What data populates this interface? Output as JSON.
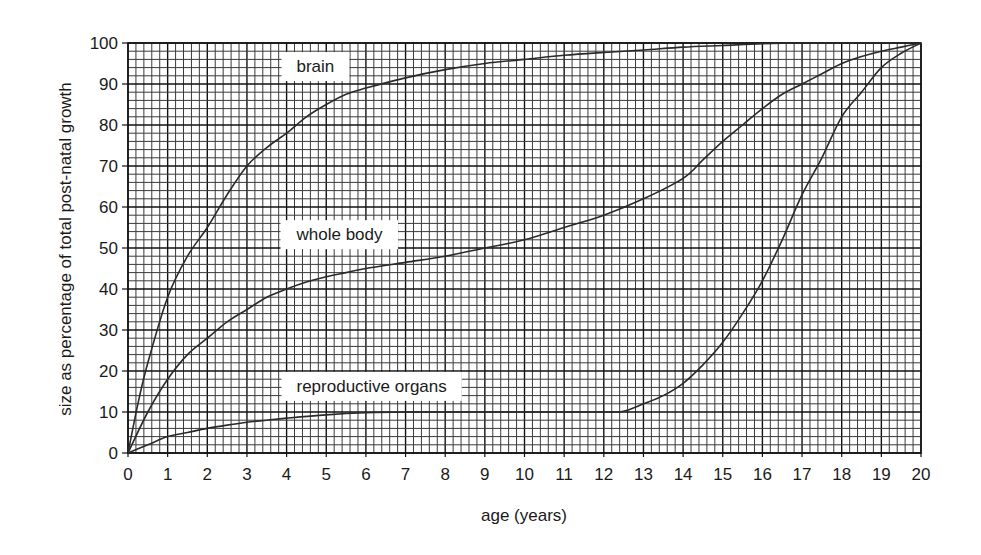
{
  "chart_data": {
    "type": "line",
    "title": "",
    "xlabel": "age (years)",
    "ylabel": "size as percentage of total post-natal growth",
    "xlim": [
      0,
      20
    ],
    "ylim": [
      0,
      100
    ],
    "x_ticks": [
      0,
      1,
      2,
      3,
      4,
      5,
      6,
      7,
      8,
      9,
      10,
      11,
      12,
      13,
      14,
      15,
      16,
      17,
      18,
      19,
      20
    ],
    "y_ticks": [
      0,
      10,
      20,
      30,
      40,
      50,
      60,
      70,
      80,
      90,
      100
    ],
    "grid": {
      "on": true,
      "x_minor_step": 0.2,
      "y_minor_step": 2,
      "style": "graph-paper"
    },
    "legend": {
      "position": "inline-labels"
    },
    "series": [
      {
        "name": "brain",
        "label_pos": {
          "x": 4.25,
          "y": 94
        },
        "points": [
          [
            0,
            0
          ],
          [
            0.25,
            12
          ],
          [
            0.5,
            22
          ],
          [
            1,
            38
          ],
          [
            1.5,
            48
          ],
          [
            2,
            55
          ],
          [
            2.5,
            63
          ],
          [
            3,
            70
          ],
          [
            3.5,
            74.5
          ],
          [
            4,
            78
          ],
          [
            4.5,
            82
          ],
          [
            5,
            85
          ],
          [
            5.5,
            87.5
          ],
          [
            6,
            89
          ],
          [
            7,
            91.5
          ],
          [
            8,
            93.5
          ],
          [
            9,
            95
          ],
          [
            10,
            96
          ],
          [
            11,
            97
          ],
          [
            12,
            97.7
          ],
          [
            13,
            98.3
          ],
          [
            14,
            99
          ],
          [
            15,
            99.4
          ],
          [
            16,
            99.8
          ],
          [
            17,
            100
          ],
          [
            18,
            100
          ],
          [
            19,
            100
          ],
          [
            20,
            100
          ]
        ]
      },
      {
        "name": "whole body",
        "label_pos": {
          "x": 4.25,
          "y": 53
        },
        "points": [
          [
            0,
            0
          ],
          [
            0.5,
            10
          ],
          [
            1,
            18
          ],
          [
            1.5,
            24
          ],
          [
            2,
            28
          ],
          [
            2.5,
            32
          ],
          [
            3,
            35
          ],
          [
            3.5,
            38
          ],
          [
            4,
            40
          ],
          [
            4.5,
            41.7
          ],
          [
            5,
            43
          ],
          [
            5.5,
            44
          ],
          [
            6,
            45
          ],
          [
            7,
            46.5
          ],
          [
            8,
            48
          ],
          [
            9,
            50
          ],
          [
            10,
            52
          ],
          [
            11,
            55
          ],
          [
            12,
            58
          ],
          [
            13,
            62
          ],
          [
            14,
            67
          ],
          [
            14.5,
            71.5
          ],
          [
            15,
            76
          ],
          [
            15.5,
            80
          ],
          [
            16,
            84
          ],
          [
            16.5,
            87.5
          ],
          [
            17,
            90
          ],
          [
            17.5,
            92.5
          ],
          [
            18,
            95
          ],
          [
            18.5,
            96.7
          ],
          [
            19,
            98
          ],
          [
            19.5,
            99
          ],
          [
            20,
            100
          ]
        ]
      },
      {
        "name": "reproductive organs",
        "label_pos": {
          "x": 4.25,
          "y": 16
        },
        "points": [
          [
            0,
            0
          ],
          [
            0.5,
            2
          ],
          [
            1,
            4
          ],
          [
            1.5,
            5
          ],
          [
            2,
            6
          ],
          [
            2.5,
            6.8
          ],
          [
            3,
            7.5
          ],
          [
            3.5,
            8
          ],
          [
            4,
            8.5
          ],
          [
            5,
            9.3
          ],
          [
            6,
            9.8
          ],
          [
            7,
            10
          ],
          [
            8,
            10
          ],
          [
            9,
            10
          ],
          [
            10,
            10
          ],
          [
            11,
            10
          ],
          [
            12,
            10
          ],
          [
            12.5,
            10.2
          ],
          [
            13,
            12
          ],
          [
            13.5,
            14
          ],
          [
            14,
            17
          ],
          [
            14.5,
            21.5
          ],
          [
            15,
            27
          ],
          [
            15.5,
            34
          ],
          [
            16,
            42
          ],
          [
            16.5,
            52
          ],
          [
            17,
            63
          ],
          [
            17.5,
            72
          ],
          [
            18,
            82
          ],
          [
            18.5,
            88
          ],
          [
            19,
            94
          ],
          [
            19.5,
            97.5
          ],
          [
            20,
            100
          ]
        ]
      }
    ]
  },
  "colors": {
    "grid_minor": "#3a3a3a",
    "grid_major": "#111111",
    "curve": "#2a2a2a",
    "text": "#1a1a1a",
    "background": "#ffffff"
  }
}
